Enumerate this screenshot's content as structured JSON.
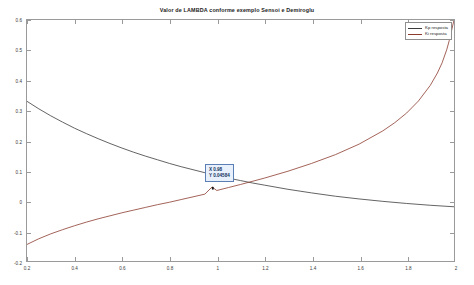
{
  "chart_data": {
    "type": "line",
    "title": "Valor de LAMBDA conforme exemplo Sensoi e Demiroglu",
    "xlabel": "",
    "ylabel": "",
    "xlim": [
      0.2,
      2.0
    ],
    "ylim": [
      -0.2,
      0.6
    ],
    "xticks": [
      "0.2",
      "0.4",
      "0.6",
      "0.8",
      "1",
      "1.2",
      "1.4",
      "1.6",
      "1.8",
      "2"
    ],
    "xtick_values": [
      0.2,
      0.4,
      0.6,
      0.8,
      1.0,
      1.2,
      1.4,
      1.6,
      1.8,
      2.0
    ],
    "yticks": [
      "0.6",
      "0.5",
      "0.4",
      "0.3",
      "0.2",
      "0.1",
      "0",
      "-0.1",
      "-0.2"
    ],
    "ytick_values": [
      0.6,
      0.5,
      0.4,
      0.3,
      0.2,
      0.1,
      0.0,
      -0.1,
      -0.2
    ],
    "grid": false,
    "legend_position": "top-right",
    "series": [
      {
        "name": "Kp resposta",
        "color": "#3c3c3c",
        "x": [
          0.2,
          0.25,
          0.3,
          0.35,
          0.4,
          0.45,
          0.5,
          0.55,
          0.6,
          0.65,
          0.7,
          0.75,
          0.8,
          0.85,
          0.9,
          0.95,
          0.98,
          1.0,
          1.05,
          1.1,
          1.15,
          1.2,
          1.3,
          1.4,
          1.5,
          1.6,
          1.7,
          1.8,
          1.9,
          2.0
        ],
        "values": [
          0.33,
          0.305,
          0.282,
          0.261,
          0.241,
          0.223,
          0.206,
          0.19,
          0.175,
          0.161,
          0.148,
          0.136,
          0.124,
          0.113,
          0.103,
          0.093,
          0.087,
          0.084,
          0.075,
          0.067,
          0.059,
          0.052,
          0.038,
          0.026,
          0.015,
          0.006,
          -0.002,
          -0.009,
          -0.015,
          -0.02
        ]
      },
      {
        "name": "Ki resposta",
        "color": "#8c3b2e",
        "x": [
          0.2,
          0.25,
          0.3,
          0.35,
          0.4,
          0.45,
          0.5,
          0.55,
          0.6,
          0.65,
          0.7,
          0.75,
          0.8,
          0.85,
          0.9,
          0.95,
          0.98,
          1.0,
          1.05,
          1.1,
          1.2,
          1.3,
          1.4,
          1.5,
          1.6,
          1.7,
          1.75,
          1.8,
          1.85,
          1.9,
          1.93,
          1.95,
          1.97,
          1.98,
          1.99,
          2.0
        ],
        "values": [
          -0.145,
          -0.126,
          -0.11,
          -0.096,
          -0.083,
          -0.071,
          -0.06,
          -0.05,
          -0.04,
          -0.031,
          -0.022,
          -0.013,
          -0.005,
          0.004,
          0.013,
          0.022,
          0.0458,
          0.034,
          0.044,
          0.054,
          0.075,
          0.098,
          0.124,
          0.153,
          0.188,
          0.232,
          0.259,
          0.291,
          0.331,
          0.383,
          0.424,
          0.458,
          0.503,
          0.532,
          0.566,
          0.6
        ]
      }
    ],
    "datatip": {
      "x_label": "X 0.98",
      "y_label": "Y 0.04584",
      "x_value": 0.98,
      "y_value": 0.04584,
      "box_color": "#e8f0fb",
      "border_color": "#5b7fb5"
    }
  }
}
